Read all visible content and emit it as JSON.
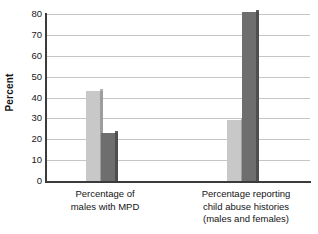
{
  "chart_data": {
    "type": "bar",
    "title": "",
    "xlabel": "",
    "ylabel": "Percent",
    "ylim": [
      0,
      80
    ],
    "yticks": [
      0,
      10,
      20,
      30,
      40,
      50,
      60,
      70,
      80
    ],
    "ytick_labels": [
      "0",
      "10",
      "20",
      "30",
      "40",
      "50",
      "60",
      "70",
      "80"
    ],
    "grid": true,
    "legend": "none",
    "categories": [
      "Percentage of males with MPD",
      "Percentage reporting child abuse histories (males and females)"
    ],
    "category_label_lines": [
      [
        "Percentage of",
        "males with MPD"
      ],
      [
        "Percentage reporting",
        "child abuse histories",
        "(males and females)"
      ]
    ],
    "series": [
      {
        "name": "light-series",
        "color": "#c8c8c8",
        "values": [
          43,
          29
        ]
      },
      {
        "name": "dark-series",
        "color": "#6e6e6e",
        "values": [
          23,
          81
        ]
      }
    ],
    "bars": [
      {
        "group": 0,
        "series": 0,
        "value": 43,
        "color": "#c8c8c8"
      },
      {
        "group": 0,
        "series": 1,
        "value": 23,
        "color": "#6e6e6e"
      },
      {
        "group": 1,
        "series": 0,
        "value": 29,
        "color": "#c8c8c8"
      },
      {
        "group": 1,
        "series": 1,
        "value": 81,
        "color": "#6e6e6e"
      }
    ],
    "colors": {
      "light_bar": "#c8c8c8",
      "dark_bar": "#6e6e6e",
      "gridline": "#c5c5c5",
      "axis": "#3b3b3b",
      "text": "#141414",
      "background": "#ffffff"
    }
  }
}
